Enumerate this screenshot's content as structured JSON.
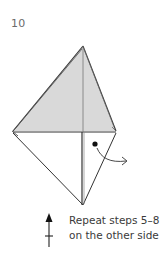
{
  "step": {
    "number": "10"
  },
  "caption": {
    "line1": "Repeat steps 5–8",
    "line2": "on the other side"
  },
  "diagram": {
    "fill_color": "#d8d8d8",
    "line_color": "#333333",
    "symbols": [
      "valley-fold-dot",
      "turn-over-arrow",
      "repeat-arrow"
    ]
  }
}
